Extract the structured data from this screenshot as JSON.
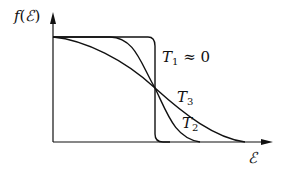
{
  "diagram": {
    "y_axis_label": {
      "func": "f",
      "open": "(",
      "var": "ℰ",
      "close": ")"
    },
    "x_axis_label": "ℰ",
    "curves": [
      {
        "name": "T1",
        "label_main": "T",
        "label_sub": "1",
        "label_suffix": " ≈ 0",
        "description": "step function at Fermi energy"
      },
      {
        "name": "T2",
        "label_main": "T",
        "label_sub": "2",
        "label_suffix": "",
        "description": "moderate temperature"
      },
      {
        "name": "T3",
        "label_main": "T",
        "label_sub": "3",
        "label_suffix": "",
        "description": "higher temperature, broadest transition"
      }
    ],
    "line_color": "#111111"
  }
}
